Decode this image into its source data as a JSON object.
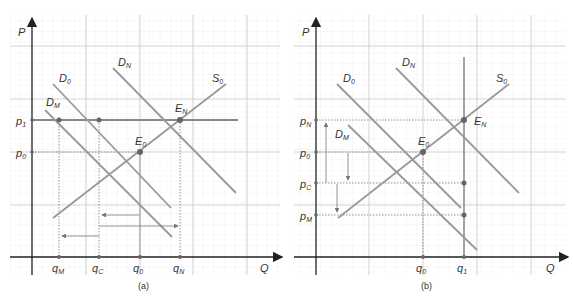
{
  "panel_a": {
    "caption": "(a)",
    "y_axis_label": "P",
    "x_axis_label": "Q",
    "price_labels": {
      "p1": "p1",
      "p0": "p0"
    },
    "quantity_labels": {
      "qM": "qM",
      "qC": "qC",
      "q0": "q0",
      "qN": "qN"
    },
    "curve_labels": {
      "D0": "D0",
      "DN": "DN",
      "DM": "DM",
      "S0": "S0"
    },
    "point_labels": {
      "E0": "E0",
      "EN": "EN"
    }
  },
  "panel_b": {
    "caption": "(b)",
    "y_axis_label": "P",
    "x_axis_label": "Q",
    "price_labels": {
      "pN": "pN",
      "p0": "p0",
      "pC": "pC",
      "pM": "pM"
    },
    "quantity_labels": {
      "q0": "q0",
      "q1": "q1"
    },
    "curve_labels": {
      "D0": "D0",
      "DN": "DN",
      "DM": "DM",
      "S0": "S0"
    },
    "point_labels": {
      "E0": "E0",
      "EN": "EN"
    }
  },
  "colors": {
    "curve": "#999999",
    "axis": "#333333",
    "grid_major": "#d0d0d0",
    "grid_minor": "#ececec",
    "point": "#666666"
  }
}
